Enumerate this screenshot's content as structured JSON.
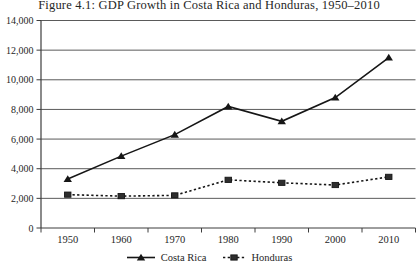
{
  "figure": {
    "title": "Figure 4.1: GDP Growth in Costa Rica and Honduras, 1950–2010"
  },
  "chart_data": {
    "type": "line",
    "title": "Figure 4.1: GDP Growth in Costa Rica and Honduras, 1950–2010",
    "categories": [
      "1950",
      "1960",
      "1970",
      "1980",
      "1990",
      "2000",
      "2010"
    ],
    "series": [
      {
        "name": "Costa Rica",
        "marker": "triangle",
        "line_style": "solid",
        "values": [
          3300,
          4850,
          6300,
          8200,
          7200,
          8800,
          11500
        ]
      },
      {
        "name": "Honduras",
        "marker": "square",
        "line_style": "dashed",
        "values": [
          2250,
          2150,
          2200,
          3250,
          3050,
          2900,
          3450
        ]
      }
    ],
    "xlabel": "",
    "ylabel": "",
    "ylim": [
      0,
      14000
    ],
    "y_ticks": [
      0,
      2000,
      4000,
      6000,
      8000,
      10000,
      12000,
      14000
    ],
    "y_tick_labels": [
      "0",
      "2,000",
      "4,000",
      "6,000",
      "8,000",
      "10,000",
      "12,000",
      "14,000"
    ],
    "grid": "horizontal",
    "legend_position": "bottom"
  },
  "colors": {
    "background": "#ffffff",
    "text": "#262626",
    "gridline": "#5a5a5a",
    "axis": "#3d3d3d",
    "series": "#161616",
    "square_fill": "#2e2e2e"
  }
}
